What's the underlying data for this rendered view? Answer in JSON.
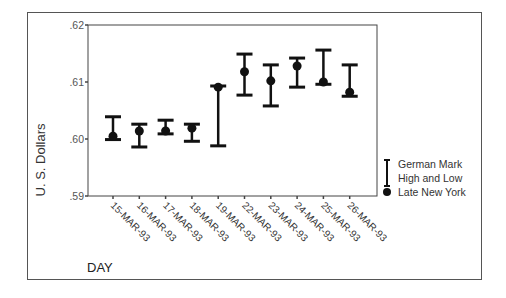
{
  "chart_data": {
    "type": "hi-lo-close",
    "title": "",
    "xlabel": "DAY",
    "ylabel": "U. S. Dollars",
    "ylim": [
      0.59,
      0.62
    ],
    "yticks": [
      ".62",
      ".61",
      ".60",
      ".59"
    ],
    "categories": [
      "15-MAR-93",
      "16-MAR-93",
      "17-MAR-93",
      "18-MAR-93",
      "19-MAR-93",
      "22-MAR-93",
      "23-MAR-93",
      "24-MAR-93",
      "25-MAR-93",
      "26-MAR-93"
    ],
    "series": [
      {
        "name": "German Mark High and Low",
        "high": [
          0.6039,
          0.6026,
          0.6033,
          0.6026,
          0.6093,
          0.6149,
          0.613,
          0.6142,
          0.6156,
          0.613
        ],
        "low": [
          0.5999,
          0.5986,
          0.6009,
          0.5996,
          0.5988,
          0.6077,
          0.6058,
          0.6091,
          0.6096,
          0.6075
        ]
      },
      {
        "name": "Late New York",
        "values": [
          0.6005,
          0.6014,
          0.6014,
          0.6019,
          0.6091,
          0.6118,
          0.6102,
          0.6128,
          0.61,
          0.6082
        ]
      }
    ],
    "legend": {
      "position": "right",
      "entries": [
        "German Mark",
        "High and Low",
        "Late New York"
      ]
    },
    "grid": false
  },
  "legend": {
    "line1": "German Mark",
    "line2": "High and Low",
    "line3": "Late New York"
  },
  "axis": {
    "x_title": "DAY",
    "y_title": "U. S. Dollars"
  }
}
